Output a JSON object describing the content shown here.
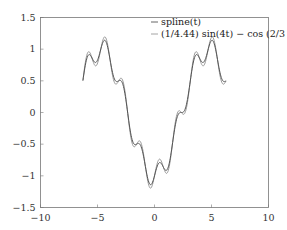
{
  "chart_data": {
    "type": "line",
    "title": "",
    "xlabel": "",
    "ylabel": "",
    "xlim": [
      -10,
      10
    ],
    "ylim": [
      -1.5,
      1.5
    ],
    "grid": false,
    "legend_position": "upper right",
    "x_ticks": [
      "-10",
      "-5",
      "0",
      "5",
      "10"
    ],
    "y_ticks": [
      "1.5",
      "1",
      "0.5",
      "0",
      "-0.5",
      "-1",
      "-1.5"
    ],
    "series": [
      {
        "name": "spline(t)",
        "color": "#555555",
        "t_range": [
          -6.28,
          6.28
        ],
        "sin_amp": 0.17,
        "sin_freq": 4,
        "cos_freq": 0.6667
      },
      {
        "name": "(1/4.44) sin(4t) − cos(2/3 t)",
        "color": "#9a9a9a",
        "t_range": [
          -6.28,
          6.28
        ],
        "sin_amp": 0.2252,
        "sin_freq": 4,
        "cos_freq": 0.6667
      }
    ],
    "legend": [
      "spline(t)",
      "(1/4.44) sin(4t) − cos (2/3 t)"
    ]
  }
}
